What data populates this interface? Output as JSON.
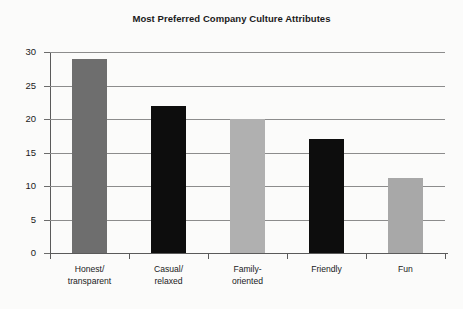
{
  "chart_data": {
    "type": "bar",
    "title": "Most Preferred Company Culture Attributes",
    "xlabel": "",
    "ylabel": "",
    "categories": [
      "Honest/\ntransparent",
      "Casual/\nrelaxed",
      "Family-\noriented",
      "Friendly",
      "Fun"
    ],
    "values": [
      29,
      22,
      20,
      17,
      11.2
    ],
    "bar_colors": [
      "#6e6e6e",
      "#0d0d0d",
      "#b0b0b0",
      "#0d0d0d",
      "#a8a8a8"
    ],
    "ylim": [
      0,
      30
    ],
    "yticks": [
      0,
      5,
      10,
      15,
      20,
      25,
      30
    ],
    "ytick_labels": [
      "0",
      "5",
      "10",
      "15",
      "20",
      "25",
      "30"
    ],
    "grid": true,
    "legend": null,
    "background_color": "#fbfbfa",
    "gridline_color": "#8c8c8c",
    "axis_color": "#5a5a5a"
  }
}
